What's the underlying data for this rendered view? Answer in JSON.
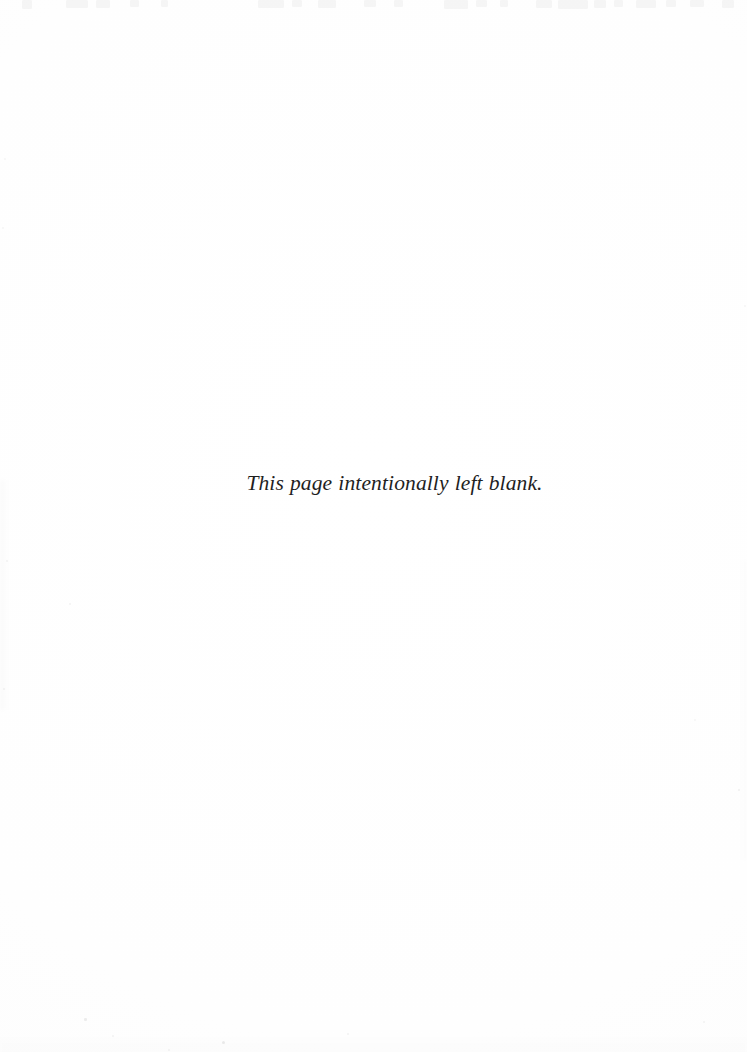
{
  "page": {
    "kind": "scanned-book-page",
    "width": 747,
    "height": 1052,
    "background_color": "#fefefe",
    "ink_color": "#1f1f1f"
  },
  "content": {
    "notice": "This page intentionally left blank."
  },
  "artifacts": {
    "top_bleed_marks": [
      {
        "x": 22,
        "y": 0,
        "w": 10,
        "h": 9
      },
      {
        "x": 66,
        "y": 0,
        "w": 22,
        "h": 8
      },
      {
        "x": 96,
        "y": 0,
        "w": 14,
        "h": 8
      },
      {
        "x": 130,
        "y": 0,
        "w": 9,
        "h": 7
      },
      {
        "x": 161,
        "y": 0,
        "w": 7,
        "h": 7
      },
      {
        "x": 258,
        "y": 0,
        "w": 26,
        "h": 8
      },
      {
        "x": 292,
        "y": 0,
        "w": 10,
        "h": 7
      },
      {
        "x": 318,
        "y": 0,
        "w": 18,
        "h": 8
      },
      {
        "x": 364,
        "y": 0,
        "w": 12,
        "h": 7
      },
      {
        "x": 394,
        "y": 0,
        "w": 9,
        "h": 7
      },
      {
        "x": 444,
        "y": 0,
        "w": 24,
        "h": 9
      },
      {
        "x": 476,
        "y": 0,
        "w": 11,
        "h": 7
      },
      {
        "x": 500,
        "y": 0,
        "w": 8,
        "h": 7
      },
      {
        "x": 536,
        "y": 0,
        "w": 16,
        "h": 8
      },
      {
        "x": 558,
        "y": 0,
        "w": 30,
        "h": 9
      },
      {
        "x": 594,
        "y": 0,
        "w": 12,
        "h": 8
      },
      {
        "x": 614,
        "y": 0,
        "w": 9,
        "h": 7
      },
      {
        "x": 636,
        "y": 0,
        "w": 20,
        "h": 8
      },
      {
        "x": 666,
        "y": 0,
        "w": 10,
        "h": 7
      },
      {
        "x": 690,
        "y": 0,
        "w": 14,
        "h": 7
      },
      {
        "x": 722,
        "y": 0,
        "w": 12,
        "h": 8
      }
    ],
    "specks": [
      {
        "x": 84,
        "y": 1018,
        "r": 1.3,
        "o": 0.07
      },
      {
        "x": 112,
        "y": 1035,
        "r": 1.0,
        "o": 0.05
      },
      {
        "x": 222,
        "y": 1041,
        "r": 1.6,
        "o": 0.08
      },
      {
        "x": 347,
        "y": 1033,
        "r": 1.0,
        "o": 0.05
      },
      {
        "x": 168,
        "y": 1049,
        "r": 1.1,
        "o": 0.05
      },
      {
        "x": 703,
        "y": 1021,
        "r": 1.0,
        "o": 0.05
      },
      {
        "x": 69,
        "y": 603,
        "r": 1.0,
        "o": 0.05
      },
      {
        "x": 738,
        "y": 789,
        "r": 1.2,
        "o": 0.06
      },
      {
        "x": 694,
        "y": 719,
        "r": 0.9,
        "o": 0.04
      },
      {
        "x": 6,
        "y": 560,
        "r": 1.1,
        "o": 0.05
      },
      {
        "x": 3,
        "y": 688,
        "r": 1.0,
        "o": 0.05
      },
      {
        "x": 2,
        "y": 227,
        "r": 1.0,
        "o": 0.04
      },
      {
        "x": 4,
        "y": 158,
        "r": 1.1,
        "o": 0.04
      },
      {
        "x": 744,
        "y": 305,
        "r": 0.9,
        "o": 0.04
      }
    ]
  }
}
